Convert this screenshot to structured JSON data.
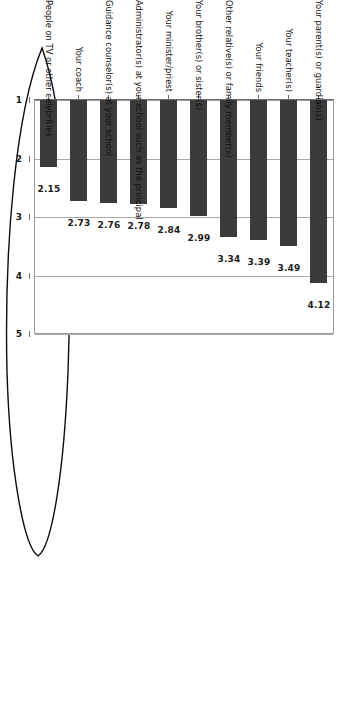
{
  "chart_data": {
    "type": "bar",
    "title": "",
    "subtitle": "",
    "xlabel": "",
    "ylabel": "",
    "orientation": "vertical-rotated-90",
    "grid": true,
    "legend": "none",
    "ylim": [
      1,
      5
    ],
    "yticks": [
      "1",
      "2",
      "3",
      "4",
      "5"
    ],
    "categories": [
      "Your parent(s) or guardian(s)",
      "Your teacher(s)",
      "Your friends",
      "Other relative(s) or family member(s)",
      "Your brother(s) or sister(s)",
      "Your minister/priest",
      "Administrator(s) at your school such as the principal",
      "Guidance counselor(s) at your school",
      "Your coach",
      "People on TV or other celebrities"
    ],
    "values": [
      4.12,
      3.49,
      3.39,
      3.34,
      2.99,
      2.84,
      2.78,
      2.76,
      2.73,
      2.15
    ],
    "value_labels": [
      "4.12",
      "3.49",
      "3.39",
      "3.34",
      "2.99",
      "2.84",
      "2.78",
      "2.76",
      "2.73",
      "2.15"
    ],
    "bar_color": "#3b3b3b",
    "grid_color": "#a8a8a8",
    "frame_color": "#9a9a9a"
  },
  "annotation": {
    "shape": "hand-drawn-ellipse",
    "target": "Your parent(s) or guardian(s)",
    "color": "#000000"
  }
}
